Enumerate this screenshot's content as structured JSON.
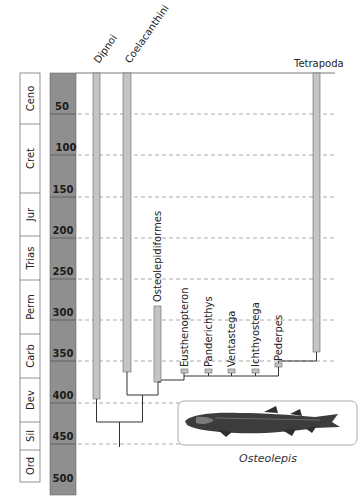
{
  "periods": [
    {
      "label": "Ceno",
      "top": 73,
      "bottom": 124
    },
    {
      "label": "Cret",
      "top": 124,
      "bottom": 193
    },
    {
      "label": "Jur",
      "top": 193,
      "bottom": 236
    },
    {
      "label": "Trias",
      "top": 236,
      "bottom": 280
    },
    {
      "label": "Perm",
      "top": 280,
      "bottom": 334
    },
    {
      "label": "Carb",
      "top": 334,
      "bottom": 378
    },
    {
      "label": "Dev",
      "top": 378,
      "bottom": 422
    },
    {
      "label": "Sil",
      "top": 422,
      "bottom": 450
    },
    {
      "label": "Ord",
      "top": 450,
      "bottom": 482
    }
  ],
  "timescale": {
    "ticks": [
      "50",
      "100",
      "150",
      "200",
      "250",
      "300",
      "350",
      "400",
      "450",
      "500"
    ],
    "unit": "Ma"
  },
  "taxa": {
    "dipnoi": "Dipnoi",
    "coelacanthini": "Coelacanthini",
    "osteolepidiformes": "Osteolepidiformes",
    "eusthenopteron": "Eusthenopteron",
    "panderichthys": "Panderichthys",
    "ventastega": "Ventastega",
    "ichthyostega": "Ichthyostega",
    "pederpes": "Pederpes",
    "tetrapoda": "Tetrapoda"
  },
  "illustration": {
    "caption": "Osteolepis"
  },
  "colors": {
    "timescale_bar": "#8f8f8f",
    "range_bar": "#c4c4c4",
    "line": "#333333",
    "grid": "#888888"
  }
}
